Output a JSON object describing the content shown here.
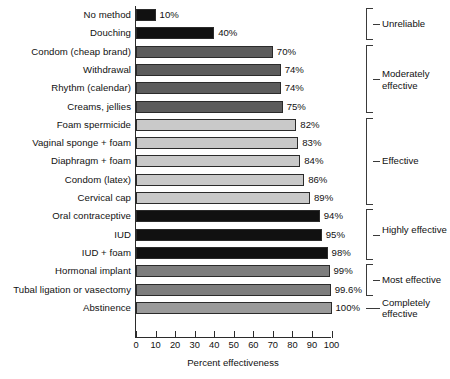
{
  "chart_data": {
    "type": "bar",
    "orientation": "horizontal",
    "title": "",
    "xlabel": "Percent effectiveness",
    "ylabel": "",
    "xlim": [
      0,
      100
    ],
    "xticks": [
      0,
      10,
      20,
      30,
      40,
      50,
      60,
      70,
      80,
      90,
      100
    ],
    "grid": false,
    "legend": false,
    "categories": [
      "No method",
      "Douching",
      "Condom (cheap brand)",
      "Withdrawal",
      "Rhythm (calendar)",
      "Creams, jellies",
      "Foam spermicide",
      "Vaginal sponge + foam",
      "Diaphragm + foam",
      "Condom (latex)",
      "Cervical cap",
      "Oral contraceptive",
      "IUD",
      "IUD + foam",
      "Hormonal implant",
      "Tubal ligation or vasectomy",
      "Abstinence"
    ],
    "values": [
      10,
      40,
      70,
      74,
      74,
      75,
      82,
      83,
      84,
      86,
      89,
      94,
      95,
      98,
      99,
      99.6,
      100
    ],
    "value_labels": [
      "10%",
      "40%",
      "70%",
      "74%",
      "74%",
      "75%",
      "82%",
      "83%",
      "84%",
      "86%",
      "89%",
      "94%",
      "95%",
      "98%",
      "99%",
      "99.6%",
      "100%"
    ],
    "bar_colors": [
      "#111111",
      "#111111",
      "#5c5c5c",
      "#5c5c5c",
      "#5c5c5c",
      "#5c5c5c",
      "#c9c9c9",
      "#c9c9c9",
      "#c9c9c9",
      "#c9c9c9",
      "#c9c9c9",
      "#111111",
      "#111111",
      "#111111",
      "#7d7d7d",
      "#7d7d7d",
      "#9a9a9a"
    ],
    "groups": [
      {
        "label": "Unreliable",
        "first_index": 0,
        "last_index": 1,
        "style": "bracket"
      },
      {
        "label": "Moderately effective",
        "first_index": 2,
        "last_index": 5,
        "style": "bracket"
      },
      {
        "label": "Effective",
        "first_index": 6,
        "last_index": 10,
        "style": "bracket"
      },
      {
        "label": "Highly effective",
        "first_index": 11,
        "last_index": 13,
        "style": "bracket"
      },
      {
        "label": "Most effective",
        "first_index": 14,
        "last_index": 15,
        "style": "bracket"
      },
      {
        "label": "Completely effective",
        "first_index": 16,
        "last_index": 16,
        "style": "line"
      }
    ]
  },
  "colors": {
    "axis": "#2b2b2b",
    "bracket": "#3a3a3a",
    "text": "#111111",
    "background": "#ffffff"
  }
}
